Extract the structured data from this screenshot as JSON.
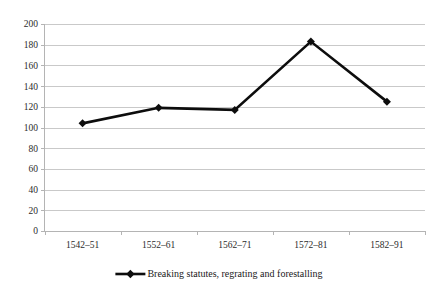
{
  "chart_data": {
    "type": "line",
    "title": "",
    "xlabel": "",
    "ylabel": "",
    "categories": [
      "1542–51",
      "1552–61",
      "1562–71",
      "1572–81",
      "1582–91"
    ],
    "series": [
      {
        "name": "Breaking statutes, regrating and forestalling",
        "values": [
          104,
          119,
          117,
          183,
          125
        ],
        "color": "#0d0d0d",
        "marker": "diamond"
      }
    ],
    "ylim": [
      0,
      200
    ],
    "ytick_step": 20,
    "yticks": [
      0,
      20,
      40,
      60,
      80,
      100,
      120,
      140,
      160,
      180,
      200
    ],
    "ytick_labels": [
      "0",
      "20",
      "40",
      "60",
      "80",
      "100",
      "120",
      "140",
      "160",
      "180",
      "200"
    ],
    "grid": {
      "horizontal": true,
      "vertical": false,
      "color": "#c9c9c9"
    },
    "legend": {
      "position": "bottom",
      "entries": [
        "Breaking statutes, regrating and forestalling"
      ]
    },
    "axis_color": "#b4b4b4",
    "background": "#ffffff"
  },
  "legend": {
    "entry_label": "Breaking statutes, regrating and forestalling"
  }
}
